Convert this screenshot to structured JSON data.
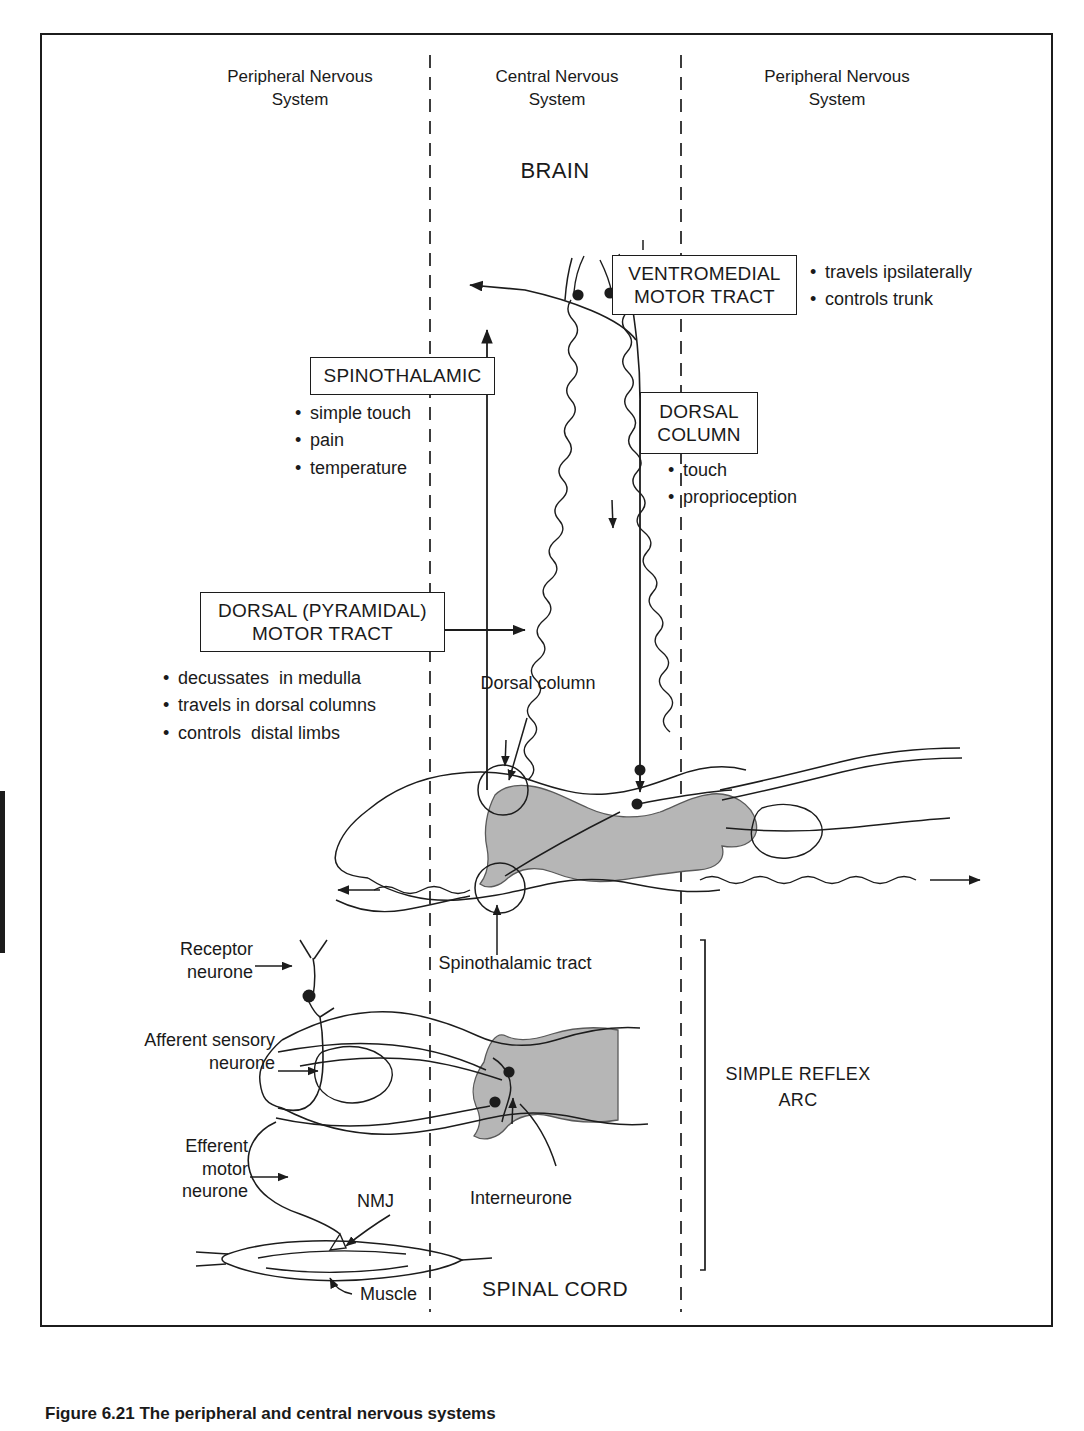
{
  "figure": {
    "caption": "Figure 6.21 The peripheral and central nervous systems"
  },
  "columns": {
    "left": "Peripheral Nervous\nSystem",
    "center": "Central Nervous\nSystem",
    "right": "Peripheral Nervous\nSystem"
  },
  "regions": {
    "brain": "BRAIN",
    "spinal_cord": "SPINAL CORD"
  },
  "tract_boxes": {
    "ventromedial": {
      "title": "VENTROMEDIAL\nMOTOR TRACT",
      "bullets": [
        "travels ipsilaterally",
        "controls trunk"
      ]
    },
    "spinothalamic": {
      "title": "SPINOTHALAMIC",
      "bullets": [
        "simple touch",
        "pain",
        "temperature"
      ]
    },
    "dorsal_column": {
      "title": "DORSAL\nCOLUMN",
      "bullets": [
        "touch",
        "proprioception"
      ]
    },
    "dorsal_pyramidal": {
      "title": "DORSAL (PYRAMIDAL)\nMOTOR TRACT",
      "bullets": [
        "decussates  in medulla",
        "travels in dorsal columns",
        "controls  distal limbs"
      ]
    }
  },
  "annotations": {
    "dorsal_column_callout": "Dorsal\ncolumn",
    "spinothalamic_tract_callout": "Spinothalamic\ntract",
    "receptor_neurone": "Receptor\nneurone",
    "afferent_sensory_neurone": "Afferent\nsensory\nneurone",
    "efferent_motor_neurone": "Efferent\nmotor\nneurone",
    "nmj": "NMJ",
    "muscle": "Muscle",
    "interneurone": "Interneurone",
    "simple_reflex_arc": "SIMPLE\nREFLEX\nARC"
  },
  "colors": {
    "ink": "#1c1c1c",
    "grey_matter": "#b6b6b6",
    "background": "#ffffff"
  }
}
